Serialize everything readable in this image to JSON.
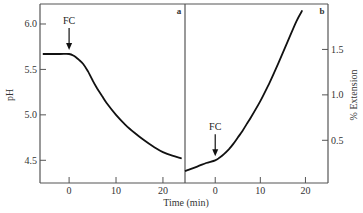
{
  "chart_data": [
    {
      "panel": "a",
      "type": "line",
      "xlabel": "Time (min)",
      "ylabel": "pH",
      "xlim": [
        -6.2,
        24.7
      ],
      "ylim": [
        4.25,
        6.22
      ],
      "xticks": [
        0,
        10,
        20
      ],
      "yticks": [
        4.5,
        5.0,
        5.5,
        6.0
      ],
      "ytick_labels": [
        "4.5",
        "5.0",
        "5.5",
        "6.0"
      ],
      "yaxis_side": "left",
      "grid": false,
      "annotation": {
        "text": "FC",
        "x": 0,
        "arrow": true
      },
      "series": [
        {
          "name": "pH",
          "x": [
            -5.6,
            -2,
            0,
            1,
            2,
            3,
            4,
            5,
            6,
            7,
            8,
            10,
            12,
            14,
            16,
            18,
            20,
            22,
            24
          ],
          "y": [
            5.67,
            5.67,
            5.67,
            5.65,
            5.61,
            5.56,
            5.48,
            5.38,
            5.29,
            5.21,
            5.13,
            5.0,
            4.89,
            4.8,
            4.72,
            4.65,
            4.59,
            4.55,
            4.52
          ]
        }
      ]
    },
    {
      "panel": "b",
      "type": "line",
      "xlabel": "Time (min)",
      "ylabel": "% Extension",
      "xlim": [
        -6.7,
        25
      ],
      "ylim": [
        0.03,
        2.0
      ],
      "xticks": [
        0,
        10,
        20
      ],
      "yticks": [
        0.5,
        1.0,
        1.5
      ],
      "ytick_labels": [
        "0.5",
        "1.0",
        "1.5"
      ],
      "yaxis_side": "right",
      "grid": false,
      "annotation": {
        "text": "FC",
        "x": 0,
        "arrow": true
      },
      "series": [
        {
          "name": "% Extension",
          "x": [
            -6.7,
            -4,
            -2,
            0,
            1,
            2,
            3,
            4,
            5,
            6,
            7,
            8,
            10,
            12,
            14,
            16,
            18,
            19.3
          ],
          "y": [
            0.16,
            0.21,
            0.25,
            0.28,
            0.31,
            0.35,
            0.4,
            0.46,
            0.53,
            0.6,
            0.68,
            0.76,
            0.93,
            1.13,
            1.35,
            1.58,
            1.81,
            1.93
          ]
        }
      ]
    }
  ],
  "labels": {
    "xlabel": "Time (min)",
    "ylabel_left": "pH",
    "ylabel_right": "% Extension",
    "panel_a": "a",
    "panel_b": "b",
    "fc_a": "FC",
    "fc_b": "FC"
  }
}
